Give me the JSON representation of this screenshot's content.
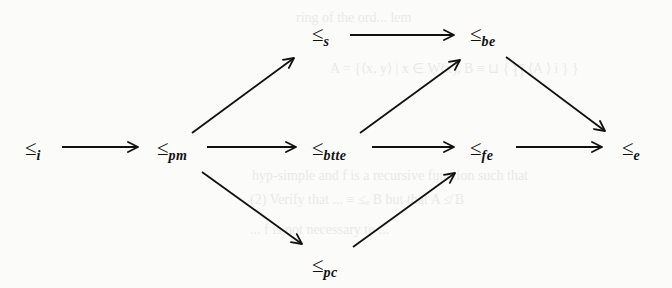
{
  "diagram": {
    "title": "",
    "relation_symbol": "≤",
    "nodes": [
      {
        "id": "i",
        "subscript": "i",
        "x": 25,
        "y": 138
      },
      {
        "id": "pm",
        "subscript": "pm",
        "x": 157,
        "y": 138
      },
      {
        "id": "s",
        "subscript": "s",
        "x": 312,
        "y": 24
      },
      {
        "id": "be",
        "subscript": "be",
        "x": 470,
        "y": 24
      },
      {
        "id": "btte",
        "subscript": "btte",
        "x": 312,
        "y": 138
      },
      {
        "id": "fe",
        "subscript": "fe",
        "x": 470,
        "y": 138
      },
      {
        "id": "e",
        "subscript": "e",
        "x": 622,
        "y": 138
      },
      {
        "id": "pc",
        "subscript": "pc",
        "x": 312,
        "y": 255
      }
    ],
    "edges": [
      {
        "from": "i",
        "to": "pm",
        "x1": 62,
        "y1": 147,
        "x2": 138,
        "y2": 147
      },
      {
        "from": "pm",
        "to": "s",
        "x1": 192,
        "y1": 133,
        "x2": 294,
        "y2": 58
      },
      {
        "from": "pm",
        "to": "btte",
        "x1": 207,
        "y1": 147,
        "x2": 296,
        "y2": 147
      },
      {
        "from": "pm",
        "to": "pc",
        "x1": 202,
        "y1": 172,
        "x2": 302,
        "y2": 244
      },
      {
        "from": "s",
        "to": "be",
        "x1": 350,
        "y1": 35,
        "x2": 454,
        "y2": 35
      },
      {
        "from": "btte",
        "to": "be",
        "x1": 360,
        "y1": 133,
        "x2": 460,
        "y2": 60
      },
      {
        "from": "btte",
        "to": "fe",
        "x1": 372,
        "y1": 147,
        "x2": 454,
        "y2": 147
      },
      {
        "from": "be",
        "to": "e",
        "x1": 506,
        "y1": 57,
        "x2": 605,
        "y2": 131
      },
      {
        "from": "fe",
        "to": "e",
        "x1": 516,
        "y1": 147,
        "x2": 602,
        "y2": 147
      },
      {
        "from": "pc",
        "to": "fe",
        "x1": 353,
        "y1": 247,
        "x2": 455,
        "y2": 173
      }
    ]
  },
  "show_through_text": [
    {
      "text": "ring of the ord...  lem",
      "x": 296,
      "y": 10
    },
    {
      "text": "A = {⟨x, y⟩ | x ∈ W(x), B ≡ ⊔ { ∏ ⟨A ⟩ i } }",
      "x": 330,
      "y": 60
    },
    {
      "text": "hyp-simple and  f is a recursive function such that",
      "x": 252,
      "y": 168
    },
    {
      "text": "(2) Verify that ... ≡ ≤ₑ B but that A ≰ B",
      "x": 250,
      "y": 192
    },
    {
      "text": "...  f is not necessary to ...",
      "x": 250,
      "y": 222
    }
  ]
}
